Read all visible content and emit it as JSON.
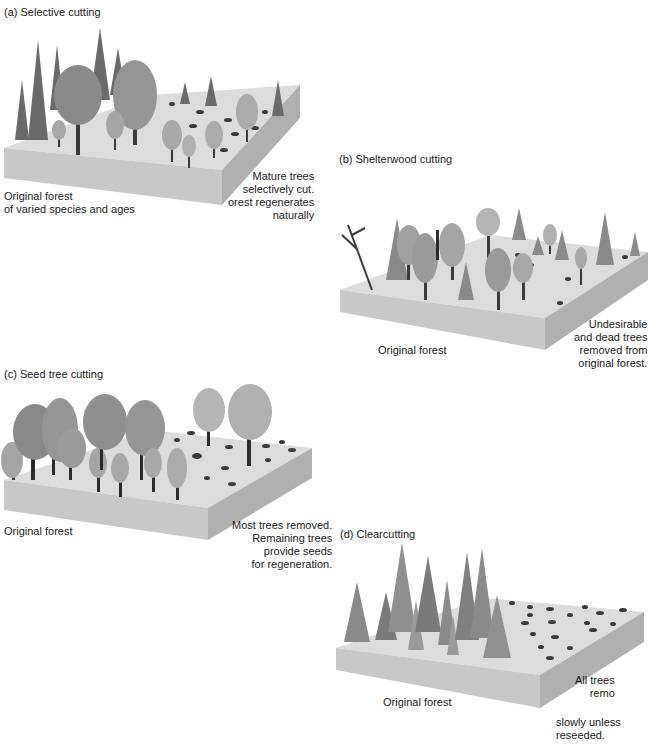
{
  "figure": {
    "panels": [
      {
        "id": "a",
        "title": "(a) Selective cutting",
        "left_label": "Original forest\nof varied species and ages",
        "right_label": "Mature trees\nselectively cut.\norest regenerates\nnaturally"
      },
      {
        "id": "b",
        "title": "(b) Shelterwood cutting",
        "left_label": "Original forest",
        "right_label": "Undesirable\nand dead trees\nremoved from\noriginal forest."
      },
      {
        "id": "c",
        "title": "(c) Seed tree cutting",
        "left_label": "Original forest",
        "right_label": "Most trees removed.\nRemaining trees\nprovide seeds\nfor regeneration."
      },
      {
        "id": "d",
        "title": "(d) Clearcutting",
        "left_label": "Original forest",
        "right_label_top": "All trees\nremo",
        "right_label_bottom": "slowly unless\nreseeded."
      }
    ],
    "colors": {
      "ground_top": "#dcdcdc",
      "block_front": "#c8c8c8",
      "block_side": "#b0b0b0",
      "tree_dark": "#5a5a5a",
      "tree_light": "#9a9a9a",
      "stump": "#3a3a3a"
    }
  }
}
